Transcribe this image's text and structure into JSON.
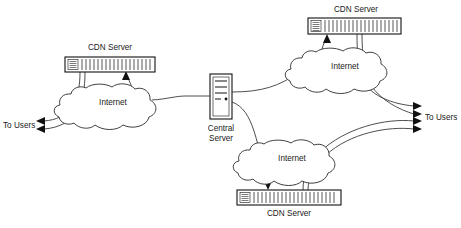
{
  "diagram": {
    "background_color": "#ffffff",
    "line_color": "#3a3a3a",
    "text_color": "#1a1a1a",
    "nodes": {
      "cdn_left": {
        "label": "CDN Server",
        "icon": "network-switch-icon",
        "x": 65,
        "y": 57,
        "width": 90,
        "height": 15
      },
      "cdn_top_right": {
        "label": "CDN Server",
        "icon": "network-switch-icon",
        "x": 308,
        "y": 18,
        "width": 93,
        "height": 16
      },
      "cdn_bottom": {
        "label": "CDN Server",
        "icon": "network-switch-icon",
        "x": 237,
        "y": 190,
        "width": 104,
        "height": 15
      },
      "central_server": {
        "label_line1": "Central",
        "label_line2": "Server",
        "icon": "server-tower-icon",
        "x": 210,
        "y": 74,
        "width": 22,
        "height": 45
      }
    },
    "clouds": {
      "cloud_left": {
        "label": "Internet",
        "cx": 113,
        "cy": 102
      },
      "cloud_top_right": {
        "label": "Internet",
        "cx": 343,
        "cy": 66
      },
      "cloud_bottom": {
        "label": "Internet",
        "cx": 291,
        "cy": 158
      }
    },
    "endpoints": {
      "users_left": {
        "label": "To Users",
        "arrow_count": 2,
        "direction": "left"
      },
      "users_right": {
        "label": "To Users",
        "arrow_count": 4,
        "direction": "right"
      }
    }
  }
}
